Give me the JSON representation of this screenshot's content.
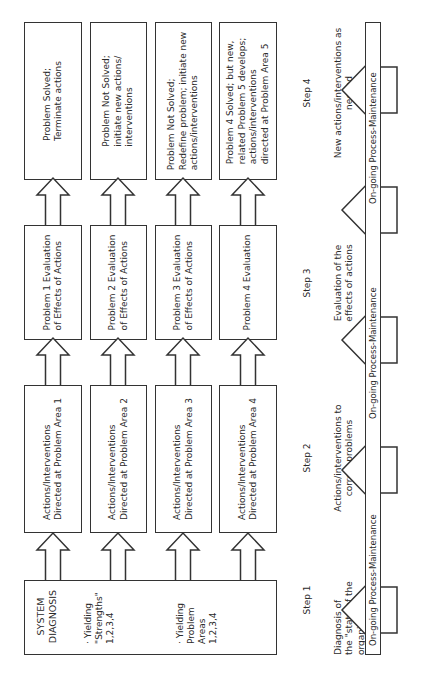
{
  "orientation": "rotated-90-ccw",
  "step1": {
    "box": {
      "title": "SYSTEM\nDIAGNOSIS",
      "output1": "· Yielding\n  \"Strengths\"\n  1,2,3,4",
      "output2": "· Yielding\n  Problem\n  Areas\n  1,2,3,4"
    },
    "label": "Step 1",
    "description": "Diagnosis of\nthe \"state of the\norganization\""
  },
  "step2": {
    "boxes": [
      "Actions/Interventions\nDirected at Problem Area 1",
      "Actions/Interventions\nDirected at Problem Area 2",
      "Actions/Interventions\nDirected at Problem Area 3",
      "Actions/Interventions\nDirected at Problem Area 4"
    ],
    "label": "Step 2",
    "description": "Actions/interventions to\ncorrect problems"
  },
  "step3": {
    "boxes": [
      "Problem 1 Evaluation\nof Effects of Actions",
      "Problem 2 Evaluation\nof Effects of Actions",
      "Problem 3 Evaluation\nof Effects of Actions",
      "Problem 4 Evaluation"
    ],
    "label": "Step 3",
    "description": "Evaluation of the\neffects of actions"
  },
  "step4": {
    "boxes": [
      "Problem Solved;\nTerminate actions",
      "Problem Not Solved;\ninitiate new actions/\ninterventions",
      "Problem Not Solved;\nRedefine problem; initiate new\nactions/interventions",
      "Problem 4 Solved; but new,\nrelated Problem 5 develops;\nactions/interventions\ndirected at Problem Area 5"
    ],
    "label": "Step 4",
    "description": "New actions/interventions as\nneeded"
  },
  "maintenance_bar": {
    "segments": [
      "On-going Process-Maintenance",
      "On-going Process-Maintenance",
      "On-going Process-Maintenance"
    ]
  },
  "colors": {
    "line": "#333333",
    "background": "#ffffff",
    "text": "#2a2a2a"
  }
}
